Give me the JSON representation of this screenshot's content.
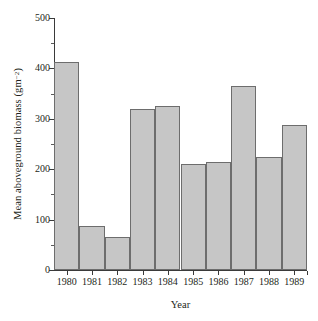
{
  "chart_data": {
    "type": "bar",
    "title": "",
    "xlabel": "Year",
    "ylabel": "Mean aboveground biomass (gm",
    "ylabel_sup": "−2",
    "ylabel_suffix": ")",
    "categories": [
      "1980",
      "1981",
      "1982",
      "1983",
      "1984",
      "1985",
      "1986",
      "1987",
      "1988",
      "1989"
    ],
    "values": [
      412,
      87,
      65,
      320,
      325,
      211,
      215,
      366,
      224,
      288
    ],
    "ylim": [
      0,
      500
    ],
    "ytick_major": [
      0,
      100,
      200,
      300,
      400,
      500
    ],
    "ytick_major_labels": [
      "0",
      "100",
      "200",
      "300",
      "400",
      "500"
    ],
    "ytick_minor": [
      50,
      150,
      250,
      350,
      450
    ],
    "grid": false,
    "legend": false,
    "bar_fill": "#c6c6c6",
    "bar_edge": "#6d6d6d",
    "axis_color": "#3a3a3a",
    "background": "#ffffff"
  }
}
